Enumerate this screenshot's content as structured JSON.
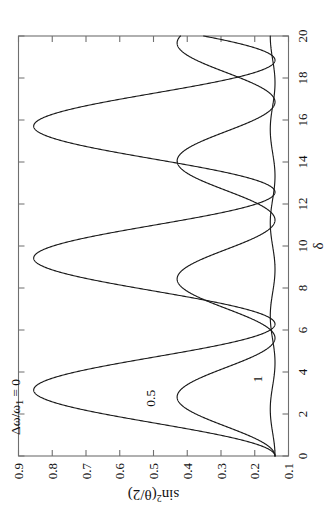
{
  "figure": {
    "orientation": "rotated-90-ccw",
    "background": "#ffffff",
    "frame_color": "#6f6f6f",
    "curve_color": "#1a1a1a"
  },
  "axes": {
    "x": {
      "title": "δ",
      "ticks": [
        0,
        2,
        4,
        6,
        8,
        10,
        12,
        14,
        16,
        18,
        20
      ],
      "tick_labels": [
        "0",
        "2",
        "4",
        "6",
        "8",
        "10",
        "12",
        "14",
        "16",
        "18",
        "20"
      ],
      "min": 0,
      "max": 20
    },
    "y": {
      "title_parts": {
        "sin": "sin",
        "exp": "2",
        "arg": "(θ/2)"
      },
      "title": "sin²(θ/2)",
      "ticks": [
        0.1,
        0.2,
        0.3,
        0.4,
        0.5,
        0.6,
        0.7,
        0.8,
        0.9
      ],
      "tick_labels": [
        "0.1",
        "0.2",
        "0.3",
        "0.4",
        "0.5",
        "0.6",
        "0.7",
        "0.8",
        "0.9"
      ],
      "min": 0.1,
      "max": 0.9
    }
  },
  "annotations": [
    {
      "name": "curve-label-0",
      "text": "Δω/ω₁ = 0",
      "x": 1.0,
      "y": 0.895
    },
    {
      "name": "curve-label-0-5",
      "text": "0.5",
      "x": 2.35,
      "y": 0.495
    },
    {
      "name": "curve-label-1",
      "text": "1",
      "x": 3.5,
      "y": 0.178
    }
  ],
  "chart_data": {
    "type": "line",
    "title": "",
    "xlabel": "δ",
    "ylabel": "sin²(θ/2)",
    "xlim": [
      0,
      20
    ],
    "ylim": [
      0.1,
      0.9
    ],
    "grid": false,
    "legend": "inline-curve-labels",
    "baseline": 0.14,
    "series": [
      {
        "name": "Δω/ω₁ = 0",
        "detuning_ratio": 0,
        "amplitude": 0.715,
        "baseline": 0.14,
        "period": 6.2832,
        "peak_value": 0.855,
        "min_value": 0.14,
        "peak_positions": [
          3.14,
          9.42,
          15.71
        ],
        "min_positions": [
          0,
          6.28,
          12.57,
          18.85
        ],
        "points_x": [
          0,
          0.5,
          1,
          1.5,
          2,
          2.5,
          3.1416,
          3.8,
          4.4,
          5,
          5.6,
          6.2832,
          6.9,
          7.5,
          8.1,
          8.7,
          9.4248,
          10.1,
          10.7,
          11.3,
          11.9,
          12.566,
          13.2,
          13.8,
          14.4,
          15,
          15.708,
          16.4,
          17,
          17.6,
          18.2,
          18.85,
          19.5,
          20
        ],
        "points_y": [
          0.14,
          0.184,
          0.309,
          0.478,
          0.645,
          0.769,
          0.855,
          0.796,
          0.684,
          0.53,
          0.365,
          0.14,
          0.192,
          0.338,
          0.505,
          0.666,
          0.855,
          0.781,
          0.657,
          0.498,
          0.334,
          0.14,
          0.2,
          0.357,
          0.528,
          0.685,
          0.855,
          0.764,
          0.629,
          0.467,
          0.307,
          0.14,
          0.239,
          0.415
        ]
      },
      {
        "name": "0.5",
        "detuning_ratio": 0.5,
        "amplitude": 0.29,
        "baseline": 0.14,
        "period": 5.6199,
        "peak_value": 0.43,
        "min_value": 0.14,
        "peak_positions": [
          2.81,
          8.43,
          14.05,
          19.67
        ],
        "min_positions": [
          0,
          5.62,
          11.24,
          16.86
        ],
        "points_x": [
          0,
          0.5,
          1,
          1.5,
          2,
          2.5,
          2.81,
          3.3,
          3.9,
          4.5,
          5.1,
          5.62,
          6.2,
          6.8,
          7.4,
          8,
          8.43,
          9,
          9.6,
          10.2,
          10.8,
          11.24,
          11.8,
          12.4,
          13,
          13.6,
          14.05,
          14.6,
          15.2,
          15.8,
          16.4,
          16.86,
          17.4,
          18,
          18.6,
          19.2,
          19.67,
          20
        ],
        "points_y": [
          0.14,
          0.158,
          0.21,
          0.282,
          0.355,
          0.412,
          0.43,
          0.411,
          0.352,
          0.274,
          0.199,
          0.14,
          0.161,
          0.224,
          0.304,
          0.38,
          0.43,
          0.405,
          0.337,
          0.254,
          0.183,
          0.14,
          0.168,
          0.24,
          0.324,
          0.396,
          0.43,
          0.396,
          0.318,
          0.232,
          0.17,
          0.14,
          0.18,
          0.262,
          0.345,
          0.414,
          0.43,
          0.424
        ]
      },
      {
        "name": "1",
        "detuning_ratio": 1,
        "amplitude": 0.014,
        "baseline": 0.14,
        "period": 4.443,
        "peak_value": 0.154,
        "min_value": 0.14,
        "points_x": [
          0,
          1,
          2,
          2.22,
          3,
          4,
          4.44,
          5,
          6,
          6.66,
          7,
          8,
          8.89,
          9,
          10,
          11,
          11.1,
          12,
          13,
          13.3,
          14,
          15,
          15.5,
          16,
          17,
          17.8,
          18,
          19,
          20
        ],
        "points_y": [
          0.14,
          0.147,
          0.153,
          0.154,
          0.151,
          0.142,
          0.14,
          0.142,
          0.151,
          0.154,
          0.153,
          0.145,
          0.14,
          0.1401,
          0.148,
          0.154,
          0.154,
          0.149,
          0.141,
          0.14,
          0.143,
          0.152,
          0.154,
          0.153,
          0.145,
          0.14,
          0.1402,
          0.149,
          0.154
        ]
      }
    ]
  }
}
